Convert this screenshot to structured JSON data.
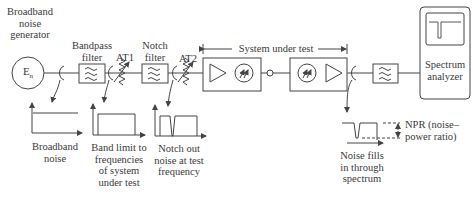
{
  "diagram": {
    "components": {
      "noise_generator": {
        "label_lines": [
          "Broadband",
          "noise",
          "generator"
        ],
        "symbol": "E_n",
        "symbol_main": "E",
        "symbol_sub": "n"
      },
      "bandpass_filter": {
        "label_lines": [
          "Bandpass",
          "filter"
        ]
      },
      "attenuator_1": {
        "label": "AT1"
      },
      "notch_filter": {
        "label_lines": [
          "Notch",
          "filter"
        ]
      },
      "attenuator_2": {
        "label": "AT2"
      },
      "system_under_test": {
        "label": "System under test"
      },
      "output_filter": {
        "label": ""
      },
      "spectrum_analyzer": {
        "label_lines": [
          "Spectrum",
          "analyzer"
        ]
      }
    },
    "spectra": [
      {
        "id": "broadband",
        "caption_lines": [
          "Broadband",
          "noise"
        ]
      },
      {
        "id": "band_limited",
        "caption_lines": [
          "Band limit to",
          "frequencies",
          "of system",
          "under test"
        ]
      },
      {
        "id": "notched",
        "caption_lines": [
          "Notch out",
          "noise at test",
          "frequency"
        ]
      },
      {
        "id": "output",
        "caption_lines": [
          "Noise fills",
          "in through",
          "spectrum"
        ]
      }
    ],
    "npr_annotation": {
      "label_lines": [
        "NPR (noise–",
        "power ratio)"
      ]
    }
  }
}
